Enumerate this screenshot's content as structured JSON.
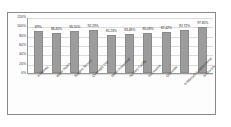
{
  "chart_data": {
    "type": "bar",
    "title": "",
    "xlabel": "",
    "ylabel": "",
    "ylim": [
      0,
      120
    ],
    "grid": true,
    "legend": "none",
    "orientation": "vertical",
    "bar_color": "#9c9c9c",
    "categories": [
      "K-Mukwa",
      "Water Rates",
      "Support Service",
      "Overnight Trip",
      "Meter Household",
      "Nursery Facility",
      "Recreation",
      "Gravesite",
      "K-Warrant Neighborhood",
      "N-Grocery"
    ],
    "values": [
      89,
      86.4,
      90.55,
      92.23,
      81.23,
      83.48,
      85.08,
      87.42,
      92.72,
      97.85
    ],
    "data_labels": [
      "89%",
      "86.40%",
      "90.55%",
      "92.23%",
      "81.23%",
      "83.48%",
      "85.08%",
      "87.42%",
      "92.72%",
      "97.85%"
    ],
    "y_ticks": [
      "120%",
      "100%",
      "80%",
      "60%",
      "40%",
      "20%",
      "0%"
    ],
    "y_tick_values": [
      120,
      100,
      80,
      60,
      40,
      20,
      0
    ]
  }
}
